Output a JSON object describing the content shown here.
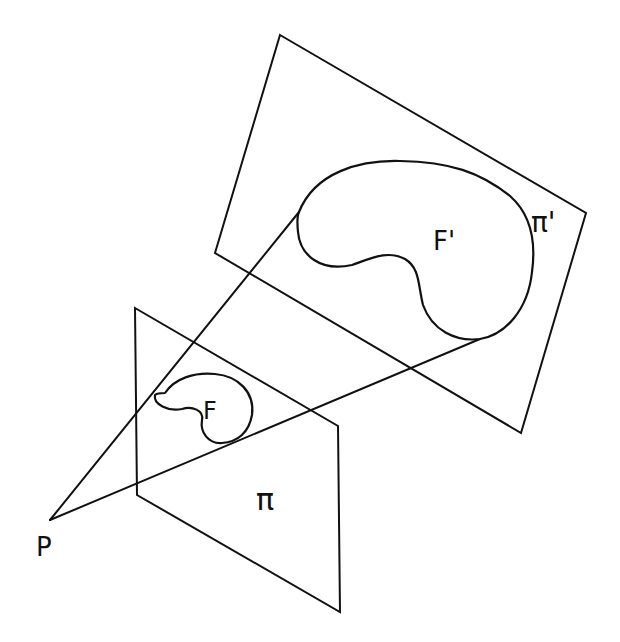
{
  "diagram": {
    "colors": {
      "stroke": "#111111",
      "background": "#ffffff"
    },
    "labels": {
      "center": "P",
      "figure": "F",
      "image_figure": "F'",
      "plane": "π",
      "image_plane": "π'"
    },
    "planes": [
      {
        "name": "π",
        "vertices": [
          [
            135,
            308
          ],
          [
            338,
            426
          ],
          [
            340,
            612
          ],
          [
            137,
            495
          ]
        ]
      },
      {
        "name": "π'",
        "vertices": [
          [
            280,
            35
          ],
          [
            586,
            213
          ],
          [
            521,
            433
          ],
          [
            215,
            253
          ]
        ]
      }
    ],
    "center_point": [
      50,
      520
    ],
    "rays": [
      {
        "from": [
          50,
          520
        ],
        "to": [
          299,
          212
        ]
      },
      {
        "from": [
          50,
          520
        ],
        "to": [
          480,
          339
        ]
      }
    ]
  }
}
